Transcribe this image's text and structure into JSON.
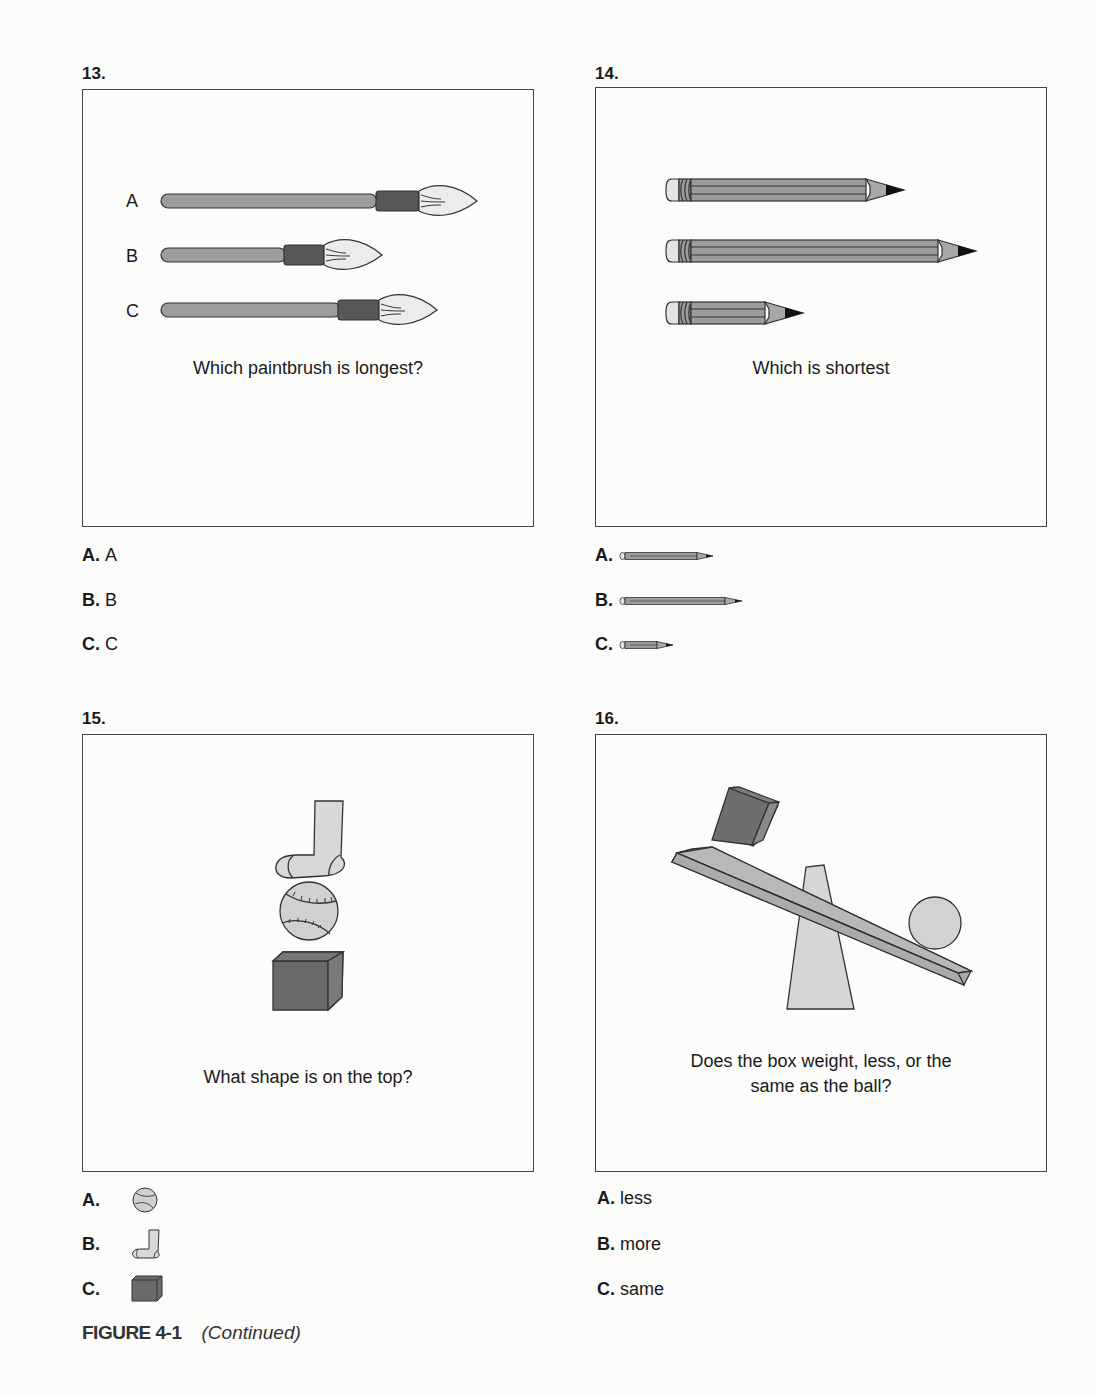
{
  "questions": [
    {
      "number": "13.",
      "prompt": "Which paintbrush is longest?",
      "item_labels": [
        "A",
        "B",
        "C"
      ],
      "options": [
        {
          "letter": "A.",
          "text": "A"
        },
        {
          "letter": "B.",
          "text": "B"
        },
        {
          "letter": "C.",
          "text": "C"
        }
      ]
    },
    {
      "number": "14.",
      "prompt": "Which is shortest",
      "options": [
        {
          "letter": "A.",
          "icon": "pencil-medium-icon"
        },
        {
          "letter": "B.",
          "icon": "pencil-long-icon"
        },
        {
          "letter": "C.",
          "icon": "pencil-short-icon"
        }
      ]
    },
    {
      "number": "15.",
      "prompt": "What shape is on the top?",
      "options": [
        {
          "letter": "A.",
          "icon": "baseball-icon"
        },
        {
          "letter": "B.",
          "icon": "sock-icon"
        },
        {
          "letter": "C.",
          "icon": "cube-icon"
        }
      ]
    },
    {
      "number": "16.",
      "prompt_line1": "Does the box weight, less, or the",
      "prompt_line2": "same as the ball?",
      "options": [
        {
          "letter": "A.",
          "text": "less"
        },
        {
          "letter": "B.",
          "text": "more"
        },
        {
          "letter": "C.",
          "text": "same"
        }
      ]
    }
  ],
  "caption": {
    "figure": "FIGURE 4-1",
    "note": "(Continued)"
  },
  "colors": {
    "handle": "#9c9c9c",
    "ferrule": "#575757",
    "bristle": "#ececec",
    "light_fill": "#d6d6d6",
    "mid_fill": "#a8a8a8",
    "dark_fill": "#666666",
    "outline": "#333333"
  }
}
